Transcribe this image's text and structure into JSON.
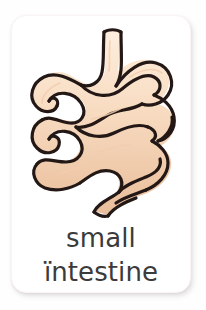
{
  "card": {
    "background_color": "#ffffff",
    "border_radius_px": 15,
    "shadow_color": "#a5a0a0"
  },
  "illustration": {
    "name": "small-intestine-illustration",
    "subject": "small intestine",
    "style": "cartoon line drawing with flat peach fill and dark outline",
    "fill_color": "#f7d7bb",
    "shade_color": "#e7bb98",
    "highlight_color": "#fdeede",
    "outline_color": "#231815",
    "outline_width_px": 3
  },
  "caption": {
    "line1": "small",
    "line2": "ïntestine",
    "text_color": "#3b3b3b",
    "font_size_px": 26
  },
  "page": {
    "background_color": "#fefefe",
    "width_px": 206,
    "height_px": 310
  }
}
